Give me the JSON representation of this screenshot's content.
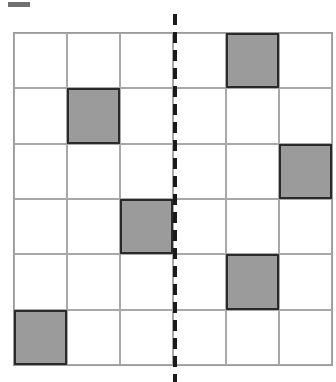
{
  "diagram": {
    "type": "grid-symmetry",
    "rows": 6,
    "cols": 6,
    "filled_cells": [
      {
        "row": 1,
        "col": 5
      },
      {
        "row": 2,
        "col": 2
      },
      {
        "row": 3,
        "col": 6
      },
      {
        "row": 4,
        "col": 3
      },
      {
        "row": 5,
        "col": 5
      },
      {
        "row": 6,
        "col": 1
      }
    ],
    "axis_line": {
      "style": "dashed",
      "orientation": "vertical",
      "between_cols": [
        3,
        4
      ]
    },
    "colors": {
      "filled": "#9b9b9b",
      "border": "#2a2a2a",
      "grid_line": "#a8a8a8",
      "axis": "#1a1a1a"
    }
  }
}
